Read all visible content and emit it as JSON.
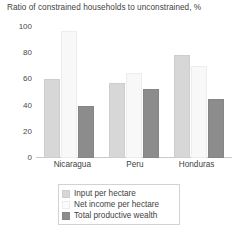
{
  "chart_data": {
    "type": "bar",
    "title": "Ratio of constrained households to unconstrained, %",
    "xlabel": "",
    "ylabel": "",
    "ylim": [
      0,
      100
    ],
    "yticks": [
      0,
      20,
      40,
      60,
      80,
      100
    ],
    "ytick_labels": [
      "0",
      "20",
      "40",
      "60",
      "80",
      "100"
    ],
    "grid": false,
    "legend_position": "bottom",
    "categories": [
      "Nicaragua",
      "Peru",
      "Honduras"
    ],
    "series": [
      {
        "name": "Input per hectare",
        "color": "#d7d7d7",
        "values": [
          60,
          57,
          79
        ]
      },
      {
        "name": "Net income per hectare",
        "color": "#f8f8f8",
        "values": [
          97,
          65,
          70
        ]
      },
      {
        "name": "Total productive wealth",
        "color": "#8c8c8c",
        "values": [
          40,
          53,
          45
        ]
      }
    ]
  },
  "colors": {
    "background": "#ffffff",
    "text": "#3f3f3f",
    "axis": "#c9c9c9",
    "series_light": "#d7d7d7",
    "series_white": "#f8f8f8",
    "series_dark": "#8c8c8c"
  }
}
